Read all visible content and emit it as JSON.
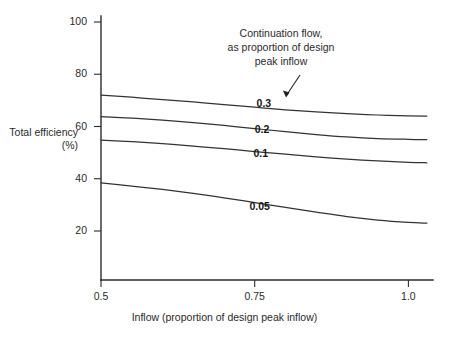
{
  "chart_data": {
    "type": "line",
    "title": "",
    "annotation": {
      "lines": [
        "Continuation flow,",
        "as proportion of design",
        "peak inflow"
      ],
      "points_to": "0.3"
    },
    "xlabel": "Inflow (proportion of design peak inflow)",
    "ylabel_lines": [
      "Total",
      "efficiency",
      "(%)"
    ],
    "xlim": [
      0.5,
      1.04
    ],
    "ylim": [
      0,
      100
    ],
    "xticks": [
      "0.5",
      "0.75",
      "1.0"
    ],
    "xtick_values": [
      0.5,
      0.75,
      1.0
    ],
    "yticks": [
      "20",
      "40",
      "60",
      "80",
      "100"
    ],
    "ytick_values": [
      20,
      40,
      60,
      80,
      100
    ],
    "grid": false,
    "legend": "inline-labels",
    "x": [
      0.5,
      0.55,
      0.6,
      0.65,
      0.7,
      0.75,
      0.8,
      0.85,
      0.9,
      0.95,
      1.0,
      1.03
    ],
    "series": [
      {
        "name": "0.3",
        "label": "0.3",
        "label_x": 0.765,
        "label_y": 68.5,
        "values": [
          72.0,
          71.2,
          70.3,
          69.4,
          68.4,
          67.4,
          66.4,
          65.6,
          64.9,
          64.4,
          64.1,
          64.0
        ]
      },
      {
        "name": "0.2",
        "label": "0.2",
        "label_x": 0.762,
        "label_y": 58.5,
        "values": [
          63.8,
          63.2,
          62.4,
          61.5,
          60.4,
          59.2,
          58.0,
          56.9,
          56.0,
          55.4,
          55.1,
          55.0
        ]
      },
      {
        "name": "0.1",
        "label": "0.1",
        "label_x": 0.76,
        "label_y": 49.5,
        "values": [
          54.8,
          54.2,
          53.4,
          52.5,
          51.5,
          50.4,
          49.4,
          48.4,
          47.5,
          46.8,
          46.3,
          46.1
        ]
      },
      {
        "name": "0.05",
        "label": "0.05",
        "label_x": 0.758,
        "label_y": 29.0,
        "values": [
          38.4,
          37.2,
          35.9,
          34.4,
          32.7,
          30.9,
          29.0,
          27.2,
          25.5,
          24.2,
          23.3,
          23.0
        ]
      }
    ]
  }
}
